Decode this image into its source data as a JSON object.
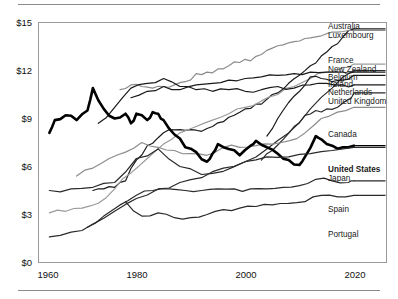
{
  "figure": {
    "background": "#ffffff",
    "rule_color": "#8a8a8a",
    "frame_color": "#999999"
  },
  "axes": {
    "y_ticks": [
      "$0",
      "$3",
      "$6",
      "$9",
      "$12",
      "$15"
    ],
    "x_ticks": [
      "1960",
      "1980",
      "2000",
      "2020"
    ]
  },
  "series_labels": [
    {
      "name": "Australia",
      "bold": false
    },
    {
      "name": "Luxembourg",
      "bold": false
    },
    {
      "name": "France",
      "bold": false
    },
    {
      "name": "New Zealand",
      "bold": false
    },
    {
      "name": "Belgium",
      "bold": false
    },
    {
      "name": "Ireland",
      "bold": false
    },
    {
      "name": "Netherlands",
      "bold": false
    },
    {
      "name": "United Kingdom",
      "bold": false
    },
    {
      "name": "Canada",
      "bold": false
    },
    {
      "name": "United States",
      "bold": true
    },
    {
      "name": "Japan",
      "bold": false
    },
    {
      "name": "Spain",
      "bold": false
    },
    {
      "name": "Portugal",
      "bold": false
    }
  ],
  "chart_data": {
    "type": "line",
    "title": "",
    "subtitle": "",
    "xlabel": "",
    "ylabel": "",
    "xlim": [
      1958,
      2022
    ],
    "ylim": [
      0,
      15
    ],
    "xticks": [
      1960,
      1980,
      2000,
      2020
    ],
    "yticks": [
      0,
      3,
      6,
      9,
      12,
      15
    ],
    "ytick_labels": [
      "$0",
      "$3",
      "$6",
      "$9",
      "$12",
      "$15"
    ],
    "grid": false,
    "legend": "right-edge-inline-labels",
    "value_unit": "USD per hour",
    "series": [
      {
        "name": "Australia",
        "color": "#1a1a1a",
        "width": 1.2,
        "x": [
          1968,
          1970,
          1972,
          1974,
          1976,
          1978,
          1980,
          1982,
          1984,
          1986,
          1988,
          1990,
          1992,
          1994,
          1996,
          1998,
          2000,
          2002,
          2004,
          2006,
          2008,
          2010,
          2012,
          2014,
          2016
        ],
        "values": [
          4.5,
          4.6,
          4.7,
          5.1,
          6.4,
          7.3,
          7.8,
          8.3,
          8.3,
          8.3,
          8.2,
          8.5,
          8.8,
          9.2,
          9.6,
          9.9,
          10.2,
          10.6,
          11.2,
          11.7,
          12.3,
          12.9,
          13.5,
          14.1,
          14.6
        ]
      },
      {
        "name": "Luxembourg",
        "color": "#8c8c8c",
        "width": 1.2,
        "x": [
          1973,
          1975,
          1977,
          1979,
          1981,
          1983,
          1985,
          1987,
          1989,
          1991,
          1993,
          1995,
          1997,
          1999,
          2001,
          2003,
          2005,
          2007,
          2009,
          2011,
          2013,
          2015
        ],
        "values": [
          10.8,
          11.1,
          11.0,
          10.9,
          11.0,
          11.1,
          11.3,
          11.8,
          11.9,
          12.1,
          12.3,
          12.5,
          12.6,
          13.0,
          13.4,
          13.6,
          13.8,
          14.0,
          14.1,
          14.3,
          14.4,
          14.5
        ]
      },
      {
        "name": "France",
        "color": "#9a9a9a",
        "width": 1.2,
        "x": [
          1960,
          1963,
          1966,
          1969,
          1972,
          1975,
          1978,
          1981,
          1984,
          1987,
          1990,
          1993,
          1996,
          1999,
          2002,
          2005,
          2008,
          2011,
          2014,
          2016
        ],
        "values": [
          3.1,
          3.2,
          3.4,
          3.7,
          4.6,
          5.6,
          6.5,
          7.4,
          8.1,
          8.5,
          8.9,
          9.3,
          9.7,
          10.1,
          10.5,
          11.0,
          11.5,
          11.9,
          12.2,
          12.4
        ]
      },
      {
        "name": "New Zealand",
        "color": "#2a2a2a",
        "width": 1.2,
        "x": [
          1960,
          1964,
          1968,
          1972,
          1976,
          1980,
          1984,
          1988,
          1992,
          1996,
          2000,
          2004,
          2008,
          2012,
          2016
        ],
        "values": [
          4.5,
          4.6,
          4.7,
          5.0,
          6.5,
          7.1,
          6.0,
          5.5,
          5.7,
          6.3,
          7.1,
          8.1,
          9.6,
          10.9,
          12.0
        ]
      },
      {
        "name": "Belgium",
        "color": "#1a1a1a",
        "width": 1.2,
        "x": [
          1975,
          1978,
          1981,
          1984,
          1987,
          1990,
          1993,
          1996,
          1999,
          2002,
          2005,
          2008,
          2011,
          2014,
          2016
        ],
        "values": [
          10.3,
          10.7,
          11.0,
          10.8,
          11.1,
          11.2,
          11.4,
          11.5,
          11.6,
          11.7,
          11.8,
          11.9,
          11.9,
          11.9,
          11.9
        ]
      },
      {
        "name": "Ireland",
        "color": "#1a1a1a",
        "width": 1.2,
        "x": [
          2000,
          2002,
          2004,
          2006,
          2008,
          2010,
          2012,
          2014,
          2016
        ],
        "values": [
          7.9,
          9.0,
          10.0,
          10.7,
          11.6,
          11.5,
          11.3,
          11.4,
          11.7
        ]
      },
      {
        "name": "Netherlands",
        "color": "#1a1a1a",
        "width": 1.2,
        "x": [
          1969,
          1972,
          1975,
          1978,
          1981,
          1984,
          1987,
          1990,
          1993,
          1996,
          1999,
          2002,
          2005,
          2008,
          2011,
          2014,
          2016
        ],
        "values": [
          8.7,
          9.7,
          10.9,
          11.2,
          11.5,
          11.0,
          10.8,
          10.7,
          10.8,
          10.7,
          10.8,
          11.0,
          10.9,
          11.1,
          11.2,
          11.1,
          11.1
        ]
      },
      {
        "name": "United Kingdom",
        "color": "#2a2a2a",
        "width": 1.2,
        "x": [
          1999,
          2001,
          2003,
          2005,
          2007,
          2009,
          2011,
          2013,
          2015,
          2016
        ],
        "values": [
          6.4,
          7.0,
          7.7,
          8.5,
          9.2,
          9.5,
          9.6,
          9.7,
          10.2,
          10.6
        ]
      },
      {
        "name": "Canada",
        "color": "#8c8c8c",
        "width": 1.2,
        "x": [
          1965,
          1968,
          1971,
          1974,
          1977,
          1980,
          1983,
          1986,
          1989,
          1992,
          1995,
          1998,
          2001,
          2004,
          2007,
          2010,
          2013,
          2016
        ],
        "values": [
          5.4,
          5.9,
          6.5,
          6.9,
          7.5,
          7.2,
          7.0,
          6.8,
          6.7,
          7.2,
          7.2,
          7.3,
          7.4,
          7.6,
          8.1,
          9.0,
          9.4,
          9.7
        ]
      },
      {
        "name": "United States",
        "color": "#000000",
        "width": 2.6,
        "x": [
          1960,
          1961,
          1963,
          1965,
          1967,
          1968,
          1970,
          1972,
          1974,
          1975,
          1976,
          1978,
          1979,
          1980,
          1981,
          1983,
          1985,
          1987,
          1989,
          1990,
          1991,
          1993,
          1995,
          1997,
          1998,
          2000,
          2002,
          2004,
          2006,
          2007,
          2009,
          2010,
          2012,
          2014,
          2016
        ],
        "values": [
          8.1,
          8.9,
          9.2,
          8.9,
          9.5,
          10.9,
          9.6,
          9.0,
          9.3,
          8.7,
          9.3,
          8.9,
          9.4,
          9.3,
          8.9,
          8.0,
          7.2,
          6.9,
          6.3,
          6.8,
          7.4,
          7.1,
          6.7,
          7.3,
          7.6,
          7.2,
          6.8,
          6.4,
          6.1,
          6.6,
          7.9,
          7.7,
          7.3,
          7.2,
          7.3
        ]
      },
      {
        "name": "Japan",
        "color": "#2a2a2a",
        "width": 1.2,
        "x": [
          1960,
          1964,
          1968,
          1972,
          1976,
          1980,
          1984,
          1988,
          1992,
          1996,
          2000,
          2004,
          2008,
          2012,
          2016
        ],
        "values": [
          1.6,
          1.9,
          2.4,
          3.2,
          4.0,
          4.6,
          5.0,
          5.3,
          5.9,
          6.3,
          6.6,
          6.6,
          6.8,
          7.0,
          7.2
        ]
      },
      {
        "name": "Spain",
        "color": "#2a2a2a",
        "width": 1.2,
        "x": [
          1967,
          1970,
          1973,
          1976,
          1979,
          1982,
          1985,
          1988,
          1991,
          1994,
          1997,
          2000,
          2003,
          2006,
          2009,
          2012,
          2015,
          2016
        ],
        "values": [
          2.2,
          2.9,
          3.6,
          4.2,
          4.5,
          4.6,
          4.5,
          4.5,
          4.6,
          4.6,
          4.6,
          4.6,
          4.7,
          4.8,
          5.2,
          5.1,
          5.0,
          5.1
        ]
      },
      {
        "name": "Portugal",
        "color": "#2a2a2a",
        "width": 1.2,
        "x": [
          1974,
          1977,
          1980,
          1983,
          1986,
          1989,
          1992,
          1995,
          1998,
          2001,
          2004,
          2007,
          2010,
          2013,
          2016
        ],
        "values": [
          3.8,
          2.9,
          3.1,
          2.8,
          2.8,
          3.0,
          3.3,
          3.4,
          3.5,
          3.6,
          3.7,
          3.8,
          4.2,
          4.1,
          4.2
        ]
      }
    ]
  }
}
